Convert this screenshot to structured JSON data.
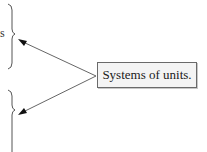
{
  "diagram": {
    "callout": {
      "label": "Systems of units."
    },
    "left_fragment_text": "s",
    "braces": [
      {
        "id": "upper",
        "top": 4,
        "bottom": 68,
        "tip_y": 34
      },
      {
        "id": "lower",
        "top": 90,
        "bottom": 152,
        "tip_y": 110
      }
    ],
    "arrows": [
      {
        "from": [
          93,
          76
        ],
        "to": [
          19,
          40
        ]
      },
      {
        "from": [
          93,
          76
        ],
        "to": [
          19,
          115
        ]
      }
    ],
    "colors": {
      "line": "#555555",
      "box_border": "#6a6a6a",
      "box_fill": "#f4f4f4",
      "text": "#1a1a1a"
    }
  }
}
